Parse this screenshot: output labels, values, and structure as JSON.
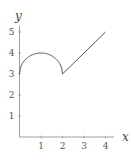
{
  "chart_data": {
    "type": "line",
    "title": "",
    "xlabel": "x",
    "ylabel": "y",
    "xlim": [
      0,
      4.4
    ],
    "ylim": [
      0,
      5.3
    ],
    "xticks": [
      1,
      2,
      3,
      4
    ],
    "yticks": [
      1,
      2,
      3,
      4,
      5
    ],
    "grid": false,
    "legend": null,
    "series": [
      {
        "name": "piecewise",
        "segments": [
          {
            "kind": "semicircle arc",
            "description": "y = 3 + sqrt(1 - (x-1)^2)",
            "x": [
              0,
              0.25,
              0.5,
              0.75,
              1,
              1.25,
              1.5,
              1.75,
              2
            ],
            "y": [
              3,
              3.66,
              3.87,
              3.97,
              4,
              3.97,
              3.87,
              3.66,
              3
            ]
          },
          {
            "kind": "line",
            "x": [
              2,
              4
            ],
            "y": [
              3,
              5
            ]
          }
        ]
      }
    ],
    "color": "#555555"
  },
  "labels": {
    "x_axis": "x",
    "y_axis": "y",
    "x_ticks": [
      "1",
      "2",
      "3",
      "4"
    ],
    "y_ticks": [
      "1",
      "2",
      "3",
      "4",
      "5"
    ]
  }
}
